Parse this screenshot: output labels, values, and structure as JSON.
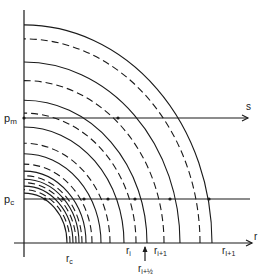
{
  "figure": {
    "origin": {
      "x": 24,
      "y": 243
    },
    "aspect_y_over_x": 1.16,
    "stroke_color": "#1a1a1a",
    "axes": {
      "horizontal_label": "r",
      "vertical_extent_top": 10,
      "horizontal_extent_right": 252
    },
    "arcs": [
      {
        "rx": 43,
        "style": "solid"
      },
      {
        "rx": 46,
        "style": "dashed"
      },
      {
        "rx": 49,
        "style": "solid"
      },
      {
        "rx": 52,
        "style": "dashed"
      },
      {
        "rx": 55,
        "style": "solid"
      },
      {
        "rx": 58,
        "style": "dashed"
      },
      {
        "rx": 62,
        "style": "solid"
      },
      {
        "rx": 68,
        "style": "dashed"
      },
      {
        "rx": 77,
        "style": "solid"
      },
      {
        "rx": 86,
        "style": "dashed"
      },
      {
        "rx": 100,
        "style": "solid"
      },
      {
        "rx": 112,
        "style": "dashed"
      },
      {
        "rx": 123,
        "style": "solid"
      },
      {
        "rx": 140,
        "style": "dashed"
      },
      {
        "rx": 156,
        "style": "solid"
      },
      {
        "rx": 176,
        "style": "dashed"
      },
      {
        "rx": 188,
        "style": "solid"
      }
    ],
    "lines": {
      "pm": {
        "label": "p_m",
        "y": 118,
        "end_label": "s",
        "arrow": true
      },
      "pc": {
        "label": "p_c",
        "y": 199,
        "arrow": false
      }
    },
    "points_pm": [
      24,
      118
    ],
    "points_pc": [
      45,
      63,
      84,
      108,
      135,
      170,
      209
    ],
    "r_labels": [
      {
        "text": "r",
        "sub": "c",
        "x": 66,
        "y": 262
      },
      {
        "text": "r",
        "sub": "i",
        "x": 126,
        "y": 254
      },
      {
        "text": "r",
        "sub": "i+1",
        "x": 154,
        "y": 254
      },
      {
        "text": "r",
        "sub": "I+1",
        "x": 222,
        "y": 254
      }
    ],
    "half_step_marker": {
      "text": "r",
      "sub": "i+½",
      "x": 145,
      "label_y": 272
    }
  },
  "labels": {
    "pm": "p",
    "pm_sub": "m",
    "pc": "p",
    "pc_sub": "c",
    "s": "s",
    "r_axis": "r"
  }
}
